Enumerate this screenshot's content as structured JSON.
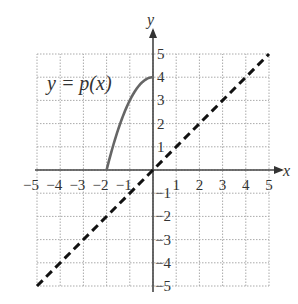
{
  "chart_data": {
    "type": "line",
    "title": "",
    "xlabel": "x",
    "ylabel": "y",
    "xlim": [
      -5,
      5
    ],
    "ylim": [
      -5,
      5
    ],
    "grid": true,
    "x_ticks": [
      -5,
      -4,
      -3,
      -2,
      -1,
      1,
      2,
      3,
      4,
      5
    ],
    "y_ticks": [
      -5,
      -4,
      -3,
      -2,
      -1,
      1,
      2,
      3,
      4,
      5
    ],
    "series": [
      {
        "name": "y = p(x)",
        "style": "solid",
        "color": "#666666",
        "x": [
          -2,
          -1.5,
          -1,
          -0.5,
          0
        ],
        "y": [
          0,
          1.75,
          3,
          3.75,
          4
        ]
      },
      {
        "name": "y = x",
        "style": "dashed",
        "color": "#111111",
        "x": [
          -5,
          5
        ],
        "y": [
          -5,
          5
        ]
      }
    ],
    "annotations": [
      {
        "text": "y = p(x)",
        "x": -3.2,
        "y": 3.6
      }
    ]
  },
  "labels": {
    "x_axis": "x",
    "y_axis": "y",
    "function_label": "y = p(x)"
  },
  "tick_labels": {
    "x": [
      "−5",
      "−4",
      "−3",
      "−2",
      "−1",
      "1",
      "2",
      "3",
      "4",
      "5"
    ],
    "y": [
      "5",
      "4",
      "3",
      "2",
      "1",
      "−1",
      "−2",
      "−3",
      "−4",
      "−5"
    ]
  }
}
